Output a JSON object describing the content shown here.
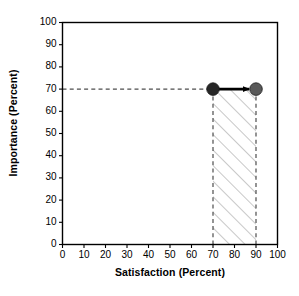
{
  "chart_data": {
    "type": "scatter",
    "title": "",
    "xlabel": "Satisfaction (Percent)",
    "ylabel": "Importance (Percent)",
    "xlim": [
      0,
      100
    ],
    "ylim": [
      0,
      100
    ],
    "xticks": [
      0,
      10,
      20,
      30,
      40,
      50,
      60,
      70,
      80,
      90,
      100
    ],
    "yticks": [
      0,
      10,
      20,
      30,
      40,
      50,
      60,
      70,
      80,
      90,
      100
    ],
    "grid": false,
    "legend": null,
    "series": [
      {
        "name": "current",
        "marker": "filled-circle",
        "color": "#262626",
        "points": [
          {
            "x": 70,
            "y": 70
          }
        ]
      },
      {
        "name": "target",
        "marker": "filled-circle",
        "color": "#595959",
        "points": [
          {
            "x": 90,
            "y": 70
          }
        ]
      }
    ],
    "annotations": [
      {
        "kind": "arrow",
        "from": {
          "x": 70,
          "y": 70
        },
        "to": {
          "x": 90,
          "y": 70
        },
        "color": "#000000",
        "label": ""
      },
      {
        "kind": "dashed-guide-horizontal",
        "y": 70,
        "from_x": 0,
        "to_x": 90,
        "color": "#4d4d4d"
      },
      {
        "kind": "dashed-guide-vertical",
        "x": 70,
        "from_y": 0,
        "to_y": 70,
        "color": "#4d4d4d"
      },
      {
        "kind": "dashed-guide-vertical",
        "x": 90,
        "from_y": 0,
        "to_y": 70,
        "color": "#4d4d4d"
      },
      {
        "kind": "hatched-region",
        "x_range": [
          70,
          90
        ],
        "y_range": [
          0,
          70
        ],
        "hatch": "forward-diagonal",
        "color": "#9a9a9a",
        "label": ""
      }
    ]
  },
  "axes": {
    "x_title": "Satisfaction (Percent)",
    "y_title": "Importance (Percent)",
    "x_tick_labels": [
      "0",
      "10",
      "20",
      "30",
      "40",
      "50",
      "60",
      "70",
      "80",
      "90",
      "100"
    ],
    "y_tick_labels": [
      "0",
      "10",
      "20",
      "30",
      "40",
      "50",
      "60",
      "70",
      "80",
      "90",
      "100"
    ],
    "frame_color": "#000000",
    "background": "#ffffff"
  }
}
